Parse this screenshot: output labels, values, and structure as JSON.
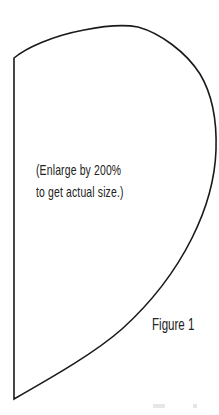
{
  "diagram": {
    "type": "sewing-pattern-piece",
    "shape": {
      "description": "Pattern piece outline: straight vertical left edge with a curved top and a sweeping curved right edge meeting at the bottom-left corner",
      "stroke_color": "#1a1a1a",
      "background_color": "#ffffff"
    },
    "note": {
      "lines": [
        "(Enlarge by 200%",
        "to get actual size.)"
      ]
    },
    "figure_label": "Figure 1"
  }
}
